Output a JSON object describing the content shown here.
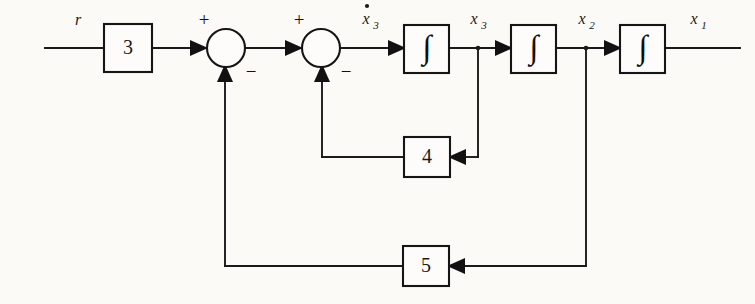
{
  "diagram": {
    "type": "control-system-block-diagram",
    "background_color": "#fbfaf7",
    "line_color": "#1a1a1a",
    "input": {
      "label": "r",
      "name": "reference-input"
    },
    "output": {
      "label": "x",
      "subscript": "1",
      "name": "output-signal"
    },
    "gain_blocks": [
      {
        "id": "gain-3",
        "label": "3",
        "x": 104,
        "y": 24,
        "w": 48,
        "h": 48
      },
      {
        "id": "gain-4",
        "label": "4",
        "x": 404,
        "y": 137,
        "w": 46,
        "h": 40
      },
      {
        "id": "gain-5",
        "label": "5",
        "x": 403,
        "y": 246,
        "w": 46,
        "h": 40
      }
    ],
    "integrators": [
      {
        "id": "integrator-1",
        "glyph": "∫",
        "output_label": "x",
        "output_subscript": "3",
        "x": 404,
        "y": 25,
        "w": 45,
        "h": 48
      },
      {
        "id": "integrator-2",
        "glyph": "∫",
        "output_label": "x",
        "output_subscript": "2",
        "x": 511,
        "y": 25,
        "w": 45,
        "h": 48
      },
      {
        "id": "integrator-3",
        "glyph": "∫",
        "output_label": "x",
        "output_subscript": "1",
        "x": 620,
        "y": 25,
        "w": 45,
        "h": 48
      }
    ],
    "summing_junctions": [
      {
        "id": "sum-1",
        "cx": 226,
        "cy": 48,
        "r": 19,
        "plus_sign": "+",
        "minus_sign": "−",
        "plus_position": "top-left",
        "minus_position": "bottom-right"
      },
      {
        "id": "sum-2",
        "cx": 321,
        "cy": 48,
        "r": 19,
        "plus_sign": "+",
        "minus_sign": "−",
        "plus_position": "top-left",
        "minus_position": "bottom-right"
      }
    ],
    "intermediate_labels": [
      {
        "id": "xdot3-label",
        "base": "x",
        "subscript": "3",
        "dot": true,
        "x": 370,
        "y": 22
      },
      {
        "id": "x3-label",
        "base": "x",
        "subscript": "3",
        "dot": false,
        "x": 478,
        "y": 22
      },
      {
        "id": "x2-label",
        "base": "x",
        "subscript": "2",
        "dot": false,
        "x": 586,
        "y": 22
      },
      {
        "id": "x1-label",
        "base": "x",
        "subscript": "1",
        "dot": false,
        "x": 698,
        "y": 22
      }
    ],
    "feedback_paths": [
      {
        "id": "inner-feedback",
        "gain": "4",
        "from": "x3",
        "to": "sum-2",
        "row_y": 157
      },
      {
        "id": "outer-feedback",
        "gain": "5",
        "from": "x2",
        "to": "sum-1",
        "row_y": 266
      }
    ],
    "geometry": {
      "main_line_y": 48,
      "input_start_x": 45,
      "output_end_x": 740,
      "x3_tap_x": 478,
      "x2_tap_x": 586,
      "inner_riser_x": 322,
      "outer_riser_x": 225
    }
  }
}
